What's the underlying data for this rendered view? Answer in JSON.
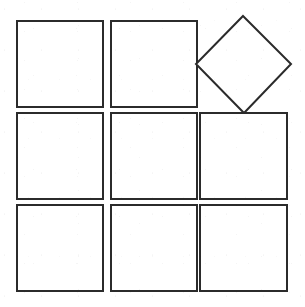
{
  "figure": {
    "background_color": "#ffffff",
    "stroke_color": "#2b2b2b",
    "fill_color": "#ffffff",
    "stroke_width": 2,
    "canvas": {
      "width": 305,
      "height": 307
    },
    "grid": {
      "rows": 3,
      "columns": 3,
      "cell_size": 86,
      "gap": 8,
      "origin_x": 17,
      "origin_y": 21
    },
    "shapes": [
      {
        "id": "square-r1c1",
        "label": "top-left square",
        "type": "square",
        "row": 1,
        "column": 1,
        "rotation": 0,
        "x": 17,
        "y": 21,
        "width": 86,
        "height": 86
      },
      {
        "id": "square-r1c2",
        "label": "top-middle square",
        "type": "square",
        "row": 1,
        "column": 2,
        "rotation": 0,
        "x": 111,
        "y": 21,
        "width": 86,
        "height": 86
      },
      {
        "id": "diamond-r1c3",
        "label": "top-right rotated square (diamond)",
        "type": "square-rotated",
        "row": 1,
        "column": 3,
        "rotation": 45,
        "center_x": 243.5,
        "center_y": 64.5,
        "side": 68,
        "vertices": [
          {
            "name": "top",
            "x": 243,
            "y": 16
          },
          {
            "name": "right",
            "x": 291,
            "y": 64
          },
          {
            "name": "bottom",
            "x": 244,
            "y": 113
          },
          {
            "name": "left",
            "x": 196,
            "y": 64
          }
        ]
      },
      {
        "id": "square-r2c1",
        "label": "middle-left square",
        "type": "square",
        "row": 2,
        "column": 1,
        "rotation": 0,
        "x": 17,
        "y": 113,
        "width": 86,
        "height": 86
      },
      {
        "id": "square-r2c2",
        "label": "center square",
        "type": "square",
        "row": 2,
        "column": 2,
        "rotation": 0,
        "x": 111,
        "y": 113,
        "width": 86,
        "height": 86
      },
      {
        "id": "square-r2c3",
        "label": "middle-right square",
        "type": "square",
        "row": 2,
        "column": 3,
        "rotation": 0,
        "x": 200,
        "y": 113,
        "width": 87,
        "height": 86
      },
      {
        "id": "square-r3c1",
        "label": "bottom-left square",
        "type": "square",
        "row": 3,
        "column": 1,
        "rotation": 0,
        "x": 17,
        "y": 205,
        "width": 86,
        "height": 86
      },
      {
        "id": "square-r3c2",
        "label": "bottom-middle square",
        "type": "square",
        "row": 3,
        "column": 2,
        "rotation": 0,
        "x": 111,
        "y": 205,
        "width": 86,
        "height": 86
      },
      {
        "id": "square-r3c3",
        "label": "bottom-right square",
        "type": "square",
        "row": 3,
        "column": 3,
        "rotation": 0,
        "x": 200,
        "y": 205,
        "width": 87,
        "height": 86
      }
    ]
  }
}
